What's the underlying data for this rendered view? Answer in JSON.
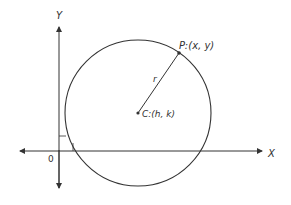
{
  "diagram": {
    "axes": {
      "x_label": "X",
      "y_label": "Y",
      "origin_label": "0"
    },
    "circle": {
      "center_label": "C:(h, k)",
      "point_label": "P:(x, y)",
      "radius_label": "r"
    },
    "colors": {
      "stroke": "#333333",
      "background": "#ffffff"
    }
  }
}
